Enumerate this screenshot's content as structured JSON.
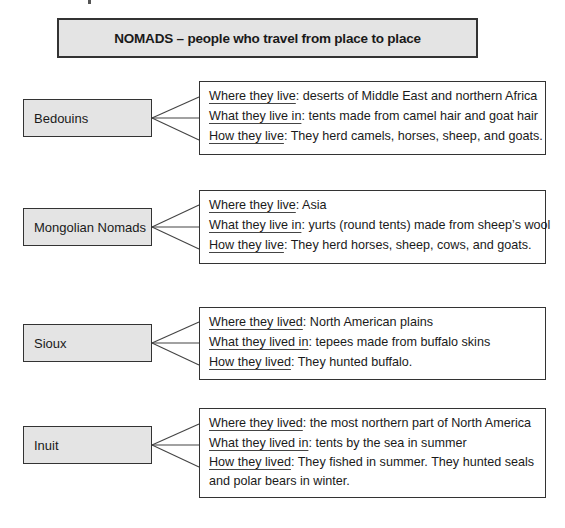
{
  "header": {
    "title": "NOMADS – people who travel from place to place"
  },
  "colors": {
    "box_fill": "#e4e4e4",
    "border": "#333333",
    "background": "#ffffff"
  },
  "groups": [
    {
      "name": "Bedouins",
      "rows": [
        {
          "key": "Where they live",
          "value": ": deserts of Middle East and northern Africa"
        },
        {
          "key": "What they live in",
          "value": ": tents made from camel hair and goat hair"
        },
        {
          "key": "How they live",
          "value": ": They herd camels, horses, sheep, and goats."
        }
      ]
    },
    {
      "name": "Mongolian Nomads",
      "rows": [
        {
          "key": "Where they live",
          "value": ": Asia"
        },
        {
          "key": "What they live in",
          "value": ": yurts (round tents) made from sheep’s wool"
        },
        {
          "key": "How they live",
          "value": ": They herd horses, sheep, cows, and goats."
        }
      ]
    },
    {
      "name": "Sioux",
      "rows": [
        {
          "key": "Where they lived",
          "value": ": North American plains"
        },
        {
          "key": "What they lived in",
          "value": ": tepees made from buffalo skins"
        },
        {
          "key": "How they lived",
          "value": ": They hunted buffalo."
        }
      ]
    },
    {
      "name": "Inuit",
      "rows": [
        {
          "key": "Where they lived",
          "value": ": the most northern part of North America"
        },
        {
          "key": "What they lived in",
          "value": ": tents by the sea in summer"
        },
        {
          "key": "How they lived",
          "value": ": They fished in summer. They hunted seals and polar bears in winter."
        }
      ]
    }
  ]
}
